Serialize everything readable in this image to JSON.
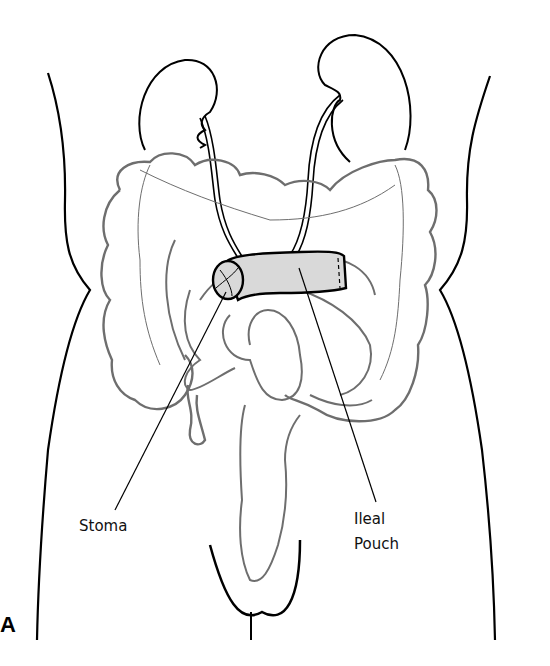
{
  "figure": {
    "panel_letter": "A",
    "labels": {
      "stoma": "Stoma",
      "ileal_pouch_line1": "Ileal",
      "ileal_pouch_line2": "Pouch"
    },
    "structures": [
      "torso-outline",
      "left-kidney",
      "right-kidney",
      "left-ureter",
      "right-ureter",
      "colon",
      "small-intestine",
      "ileal-pouch",
      "stoma",
      "rectum",
      "pelvis"
    ],
    "colors": {
      "outline": "#000000",
      "bowel": "#6e6e6e",
      "pouch_fill": "#d9d9d9"
    }
  }
}
